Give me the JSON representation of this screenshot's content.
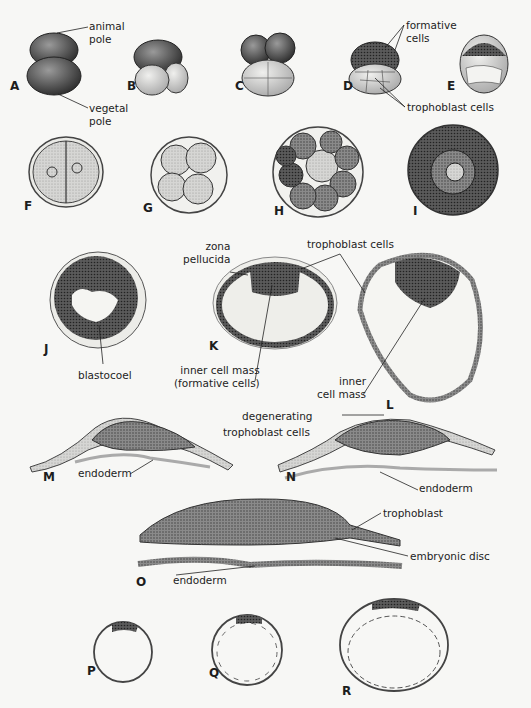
{
  "figure": {
    "panels": [
      {
        "id": "A",
        "x": 10,
        "y": 88
      },
      {
        "id": "B",
        "x": 127,
        "y": 88
      },
      {
        "id": "C",
        "x": 235,
        "y": 88
      },
      {
        "id": "D",
        "x": 343,
        "y": 88
      },
      {
        "id": "E",
        "x": 447,
        "y": 88
      },
      {
        "id": "F",
        "x": 24,
        "y": 208
      },
      {
        "id": "G",
        "x": 143,
        "y": 210
      },
      {
        "id": "H",
        "x": 274,
        "y": 213
      },
      {
        "id": "I",
        "x": 413,
        "y": 213
      },
      {
        "id": "J",
        "x": 44,
        "y": 351
      },
      {
        "id": "K",
        "x": 209,
        "y": 348
      },
      {
        "id": "L",
        "x": 386,
        "y": 398
      },
      {
        "id": "M",
        "x": 43,
        "y": 469
      },
      {
        "id": "N",
        "x": 286,
        "y": 469
      },
      {
        "id": "O",
        "x": 136,
        "y": 584
      },
      {
        "id": "P",
        "x": 87,
        "y": 666
      },
      {
        "id": "Q",
        "x": 209,
        "y": 668
      },
      {
        "id": "R",
        "x": 342,
        "y": 686
      }
    ],
    "labels": {
      "animal_pole": [
        "animal",
        "pole"
      ],
      "vegetal_pole": [
        "vegetal",
        "pole"
      ],
      "formative_cells": [
        "formative",
        "cells"
      ],
      "trophoblast_cells_top": "trophoblast cells",
      "zona_pellucida": [
        "zona",
        "pellucida"
      ],
      "trophoblast_cells_mid": "trophoblast cells",
      "blastocoel": "blastocoel",
      "inner_cell_mass_K": [
        "inner cell mass",
        "(formative cells)"
      ],
      "inner_cell_mass_L": [
        "inner",
        "cell mass"
      ],
      "degenerating_trophoblast": [
        "degenerating",
        "trophoblast cells"
      ],
      "endoderm_M": "endoderm",
      "endoderm_N": "endoderm",
      "trophoblast_O": "trophoblast",
      "embryonic_disc": "embryonic disc",
      "endoderm_O": "endoderm"
    }
  }
}
